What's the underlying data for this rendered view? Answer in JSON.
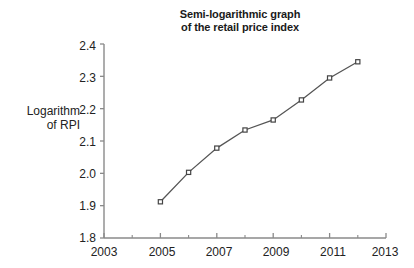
{
  "chart_data": {
    "type": "line",
    "title": "Semi-logarithmic graph of the retail price index",
    "title_lines": [
      "Semi-logarithmic graph",
      "of the retail price index"
    ],
    "xlabel": "",
    "ylabel": "Logarithm of RPI",
    "ylabel_lines": [
      "Logarithm",
      "of RPI"
    ],
    "x": [
      2005,
      2006,
      2007,
      2008,
      2009,
      2010,
      2011,
      2012
    ],
    "values": [
      1.912,
      2.003,
      2.078,
      2.134,
      2.165,
      2.227,
      2.295,
      2.345
    ],
    "xlim": [
      2003,
      2013
    ],
    "ylim": [
      1.8,
      2.4
    ],
    "x_ticks": [
      2003,
      2005,
      2007,
      2009,
      2011,
      2013
    ],
    "x_tick_labels": [
      "2003",
      "2005",
      "2007",
      "2009",
      "2011",
      "2013"
    ],
    "x_minor_ticks": [
      2004,
      2006,
      2008,
      2010,
      2012
    ],
    "y_ticks": [
      1.8,
      1.9,
      2.0,
      2.1,
      2.2,
      2.3,
      2.4
    ],
    "y_tick_labels": [
      "1.8",
      "1.9",
      "2.0",
      "2.1",
      "2.2",
      "2.3",
      "2.4"
    ],
    "grid": false,
    "legend": null,
    "line_color": "#555555",
    "marker": "square-open",
    "marker_color": "#444444",
    "axis_color": "#888888"
  },
  "axis": {
    "y_labels": [
      "2.4",
      "2.3",
      "2.2",
      "2.1",
      "2.0",
      "1.9",
      "1.8"
    ],
    "x_labels": [
      "2003",
      "2005",
      "2007",
      "2009",
      "2011",
      "2013"
    ]
  },
  "title": {
    "line1": "Semi-logarithmic graph",
    "line2": "of the retail price index"
  },
  "ylabel": {
    "line1": "Logarithm",
    "line2": "of RPI"
  }
}
